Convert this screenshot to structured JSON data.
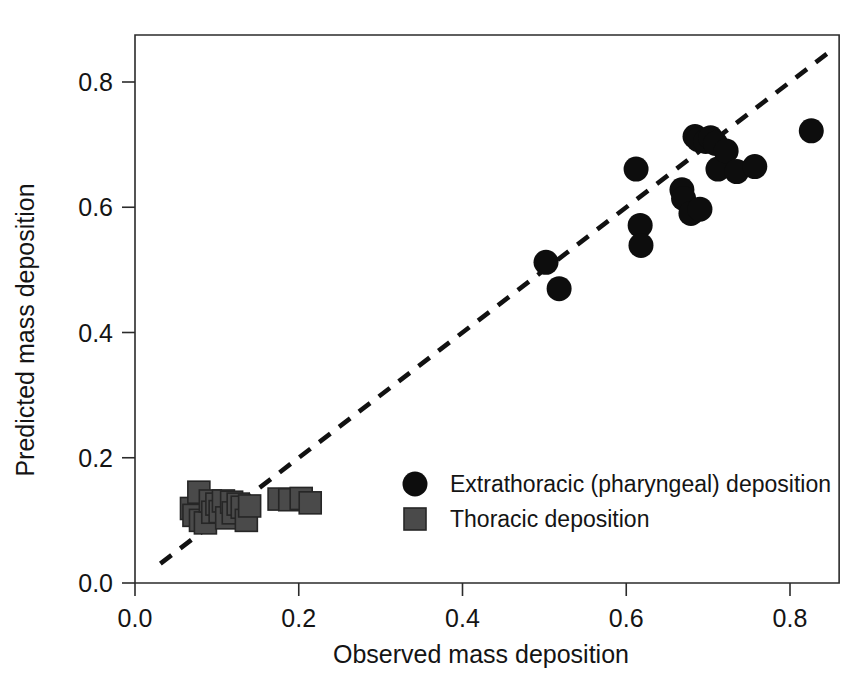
{
  "chart_data": {
    "type": "scatter",
    "title": "",
    "xlabel": "Observed mass deposition",
    "ylabel": "Predicted mass deposition",
    "xlim": [
      0.0,
      0.86
    ],
    "ylim": [
      0.0,
      0.875
    ],
    "xticks": [
      "0.0",
      "0.2",
      "0.4",
      "0.6",
      "0.8"
    ],
    "xtick_values": [
      0.0,
      0.2,
      0.4,
      0.6,
      0.8
    ],
    "yticks": [
      "0.0",
      "0.2",
      "0.4",
      "0.6",
      "0.8"
    ],
    "ytick_values": [
      0.0,
      0.2,
      0.4,
      0.6,
      0.8
    ],
    "grid": false,
    "legend_position": "center-right-inside",
    "reference_line": {
      "name": "identity-line-1-to-1",
      "style": "dashed",
      "x": [
        0.031,
        0.851
      ],
      "y": [
        0.031,
        0.851
      ]
    },
    "series": [
      {
        "name": "Extrathoracic (pharyngeal) deposition",
        "marker": "circle",
        "color": "#0d0d0d",
        "points": [
          [
            0.502,
            0.512
          ],
          [
            0.518,
            0.47
          ],
          [
            0.612,
            0.661
          ],
          [
            0.617,
            0.571
          ],
          [
            0.618,
            0.539
          ],
          [
            0.668,
            0.628
          ],
          [
            0.67,
            0.614
          ],
          [
            0.679,
            0.59
          ],
          [
            0.684,
            0.713
          ],
          [
            0.688,
            0.708
          ],
          [
            0.69,
            0.597
          ],
          [
            0.697,
            0.705
          ],
          [
            0.703,
            0.711
          ],
          [
            0.709,
            0.702
          ],
          [
            0.712,
            0.661
          ],
          [
            0.722,
            0.69
          ],
          [
            0.735,
            0.657
          ],
          [
            0.757,
            0.665
          ],
          [
            0.826,
            0.722
          ]
        ]
      },
      {
        "name": "Thoracic deposition",
        "marker": "square",
        "color": "#4a4a4a",
        "points": [
          [
            0.069,
            0.119
          ],
          [
            0.072,
            0.108
          ],
          [
            0.078,
            0.145
          ],
          [
            0.08,
            0.1
          ],
          [
            0.086,
            0.096
          ],
          [
            0.092,
            0.131
          ],
          [
            0.095,
            0.113
          ],
          [
            0.1,
            0.126
          ],
          [
            0.104,
            0.114
          ],
          [
            0.108,
            0.131
          ],
          [
            0.112,
            0.104
          ],
          [
            0.118,
            0.129
          ],
          [
            0.12,
            0.112
          ],
          [
            0.126,
            0.126
          ],
          [
            0.131,
            0.121
          ],
          [
            0.136,
            0.1
          ],
          [
            0.14,
            0.123
          ],
          [
            0.176,
            0.134
          ],
          [
            0.189,
            0.133
          ],
          [
            0.203,
            0.135
          ],
          [
            0.214,
            0.128
          ]
        ]
      }
    ],
    "legend": [
      {
        "label": "Extrathoracic (pharyngeal) deposition",
        "marker": "circle",
        "color": "#0d0d0d"
      },
      {
        "label": "Thoracic deposition",
        "marker": "square",
        "color": "#4a4a4a"
      }
    ]
  }
}
